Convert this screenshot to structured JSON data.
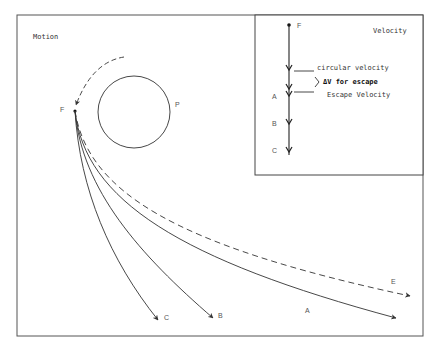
{
  "motion_panel": {
    "title": "Motion",
    "planet_label": "P",
    "start_label": "F",
    "trajectory_labels": {
      "A": "A",
      "B": "B",
      "C": "C",
      "E": "E"
    }
  },
  "velocity_panel": {
    "title": "Velocity",
    "start_label": "F",
    "circular_velocity": "circular velocity",
    "delta_v": "ΔV for escape",
    "escape_velocity": "Escape Velocity",
    "level_labels": [
      "A",
      "B",
      "C"
    ]
  },
  "colors": {
    "stroke": "#333333",
    "background": "#ffffff"
  }
}
